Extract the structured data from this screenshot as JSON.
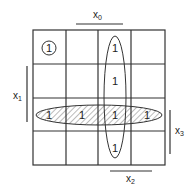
{
  "kmap": {
    "rows": 4,
    "cols": 4,
    "cells": [
      [
        "1",
        "",
        "1",
        ""
      ],
      [
        "",
        "",
        "1",
        ""
      ],
      [
        "1",
        "1",
        "1",
        "1"
      ],
      [
        "",
        "",
        "1",
        ""
      ]
    ],
    "labels": {
      "x0": {
        "base": "x",
        "sub": "0"
      },
      "x1": {
        "base": "x",
        "sub": "1"
      },
      "x2": {
        "base": "x",
        "sub": "2"
      },
      "x3": {
        "base": "x",
        "sub": "3"
      }
    },
    "groups": [
      {
        "name": "single-cell-r0c0",
        "cells": [
          [
            0,
            0
          ]
        ]
      },
      {
        "name": "vertical-column-c2",
        "cells": [
          [
            0,
            2
          ],
          [
            1,
            2
          ],
          [
            2,
            2
          ],
          [
            3,
            2
          ]
        ]
      },
      {
        "name": "horizontal-row-r2-hatched",
        "cells": [
          [
            2,
            0
          ],
          [
            2,
            1
          ],
          [
            2,
            2
          ],
          [
            2,
            3
          ]
        ]
      }
    ]
  }
}
